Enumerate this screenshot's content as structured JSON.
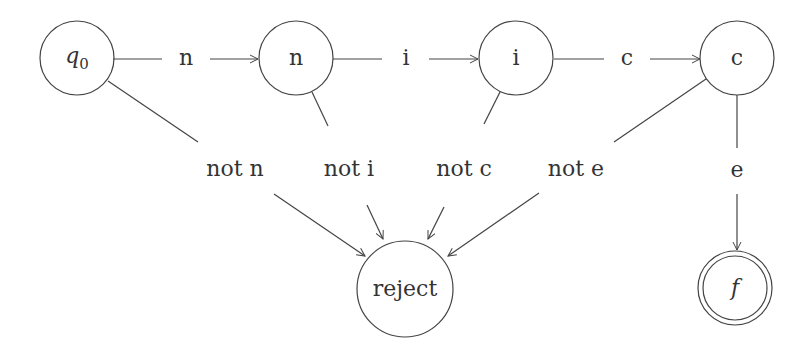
{
  "diagram": {
    "type": "finite-state-automaton",
    "states": [
      {
        "id": "q0",
        "label": "q0",
        "x": 77,
        "y": 58,
        "r": 37,
        "accepting": false
      },
      {
        "id": "n",
        "label": "n",
        "x": 296,
        "y": 58,
        "r": 37,
        "accepting": false
      },
      {
        "id": "i",
        "label": "i",
        "x": 516,
        "y": 58,
        "r": 37,
        "accepting": false
      },
      {
        "id": "c",
        "label": "c",
        "x": 737,
        "y": 58,
        "r": 37,
        "accepting": false
      },
      {
        "id": "reject",
        "label": "reject",
        "x": 405,
        "y": 284,
        "r": 48,
        "accepting": false
      },
      {
        "id": "f",
        "label": "f",
        "x": 737,
        "y": 288,
        "r": 37,
        "accepting": true
      }
    ],
    "transitions": [
      {
        "from": "q0",
        "to": "n",
        "label": "n"
      },
      {
        "from": "n",
        "to": "i",
        "label": "i"
      },
      {
        "from": "i",
        "to": "c",
        "label": "c"
      },
      {
        "from": "c",
        "to": "f",
        "label": "e"
      },
      {
        "from": "q0",
        "to": "reject",
        "label": "not n"
      },
      {
        "from": "n",
        "to": "reject",
        "label": "not i"
      },
      {
        "from": "i",
        "to": "reject",
        "label": "not c"
      },
      {
        "from": "c",
        "to": "reject",
        "label": "not e"
      }
    ]
  }
}
